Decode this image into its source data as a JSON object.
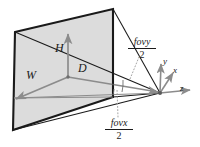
{
  "figure": {
    "colors": {
      "plane_fill": "#dcdcdc",
      "plane_edge": "#1a1a1a",
      "arrow_gray": "#8c8c8c",
      "ray_dark": "#1a1a1a",
      "dotted": "#9a9a9a",
      "text": "#1a1a1a",
      "background": "#ffffff"
    },
    "labels": {
      "height": "H",
      "width": "W",
      "distance": "D"
    },
    "axes": {
      "x": "x",
      "y": "y",
      "z": "z"
    },
    "fractions": {
      "fovy": {
        "numerator": "fovy",
        "denominator": "2"
      },
      "fovx": {
        "numerator": "fovx",
        "denominator": "2"
      }
    }
  }
}
